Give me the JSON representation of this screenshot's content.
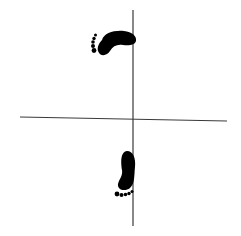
{
  "diagram": {
    "title": "Footprint orientation diagram",
    "colors": {
      "background": "#ffffff",
      "axis": "#3a3a3a",
      "footprint": "#000000"
    },
    "axes": {
      "horizontal": {
        "x1": 20,
        "y1": 117,
        "x2": 227,
        "y2": 121
      },
      "vertical": {
        "x1": 133,
        "y1": 10,
        "x2": 133,
        "y2": 226
      }
    },
    "footprints": [
      {
        "id": "top",
        "position": "upper-left quadrant",
        "direction": "left"
      },
      {
        "id": "bottom",
        "position": "lower-left quadrant",
        "direction": "down"
      }
    ]
  }
}
